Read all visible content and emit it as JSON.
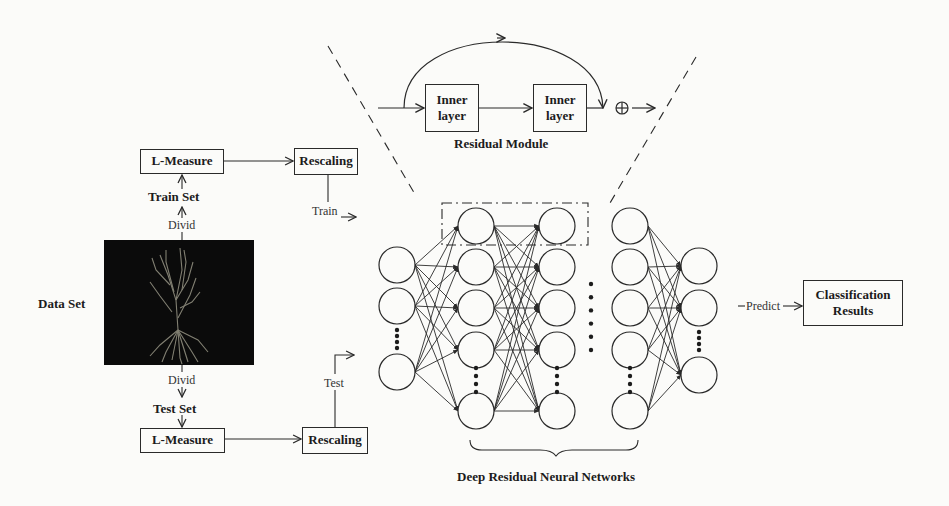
{
  "diagram": {
    "residual_module": {
      "title": "Residual Module",
      "inner_layers": [
        {
          "line1": "Inner",
          "line2": "layer"
        },
        {
          "line1": "Inner",
          "line2": "layer"
        }
      ],
      "add_symbol": "⊕"
    },
    "data_set": {
      "label": "Data Set",
      "image": "neuron-morphology-image"
    },
    "train_branch": {
      "divide_label": "Divid",
      "set_label": "Train Set",
      "measure_label": "L-Measure",
      "rescale_label": "Rescaling",
      "flow_label": "Train"
    },
    "test_branch": {
      "divide_label": "Divid",
      "set_label": "Test Set",
      "measure_label": "L-Measure",
      "rescale_label": "Rescaling",
      "flow_label": "Test"
    },
    "network": {
      "title": "Deep Residual Neural Networks",
      "columns": [
        {
          "x": 397,
          "nodes": [
            265,
            306,
            372
          ],
          "dots": [
            330,
            348
          ]
        },
        {
          "x": 476,
          "nodes": [
            226,
            267,
            308,
            350,
            411
          ],
          "dots": [
            368,
            392
          ]
        },
        {
          "x": 557,
          "nodes": [
            226,
            267,
            308,
            350,
            411
          ],
          "dots": [
            368,
            392
          ]
        },
        {
          "x": 630,
          "nodes": [
            226,
            267,
            308,
            350,
            411
          ],
          "dots": [
            368,
            392
          ]
        },
        {
          "x": 699,
          "nodes": [
            266,
            308,
            375
          ],
          "dots": [
            332,
            350
          ]
        }
      ],
      "ellipsis_between": {
        "x": 591,
        "y_from": 284,
        "y_to": 350
      }
    },
    "output": {
      "predict_label": "Predict",
      "result_line1": "Classification",
      "result_line2": "Results"
    },
    "colors": {
      "line": "#2a2a2a",
      "background": "#fbfbf9",
      "image_bg": "#0b0b0b",
      "neuron": "#8f8d7e"
    }
  }
}
